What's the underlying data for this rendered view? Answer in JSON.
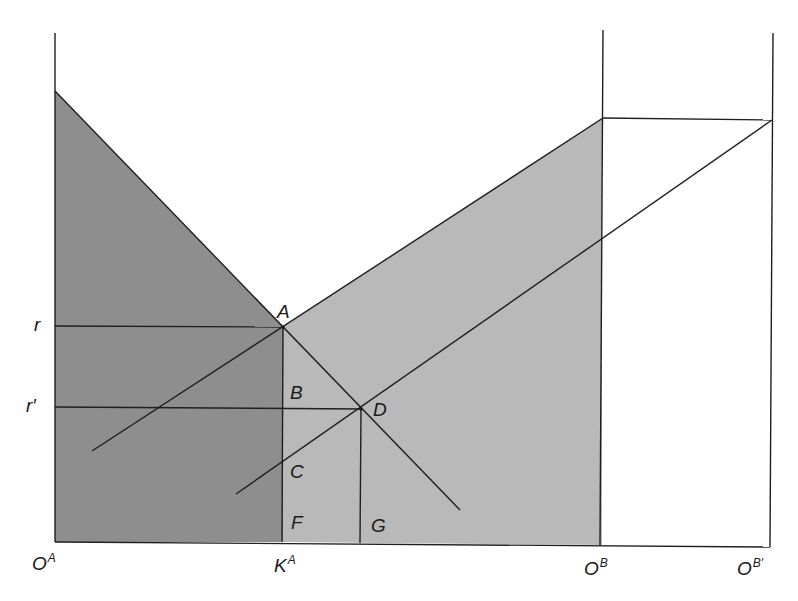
{
  "diagram": {
    "type": "two-country capital allocation (box diagram)",
    "colors": {
      "background": "#ffffff",
      "dark_region": "#8e8e8e",
      "light_region": "#b9b9b9",
      "line": "#1f1f1f"
    },
    "points": {
      "A": "A",
      "B": "B",
      "C": "C",
      "D": "D",
      "F": "F",
      "G": "G"
    },
    "axis_labels": {
      "r": "r",
      "r_prime": "r′",
      "origin_a": {
        "base": "O",
        "sup": "A"
      },
      "k_a": {
        "base": "K",
        "sup": "A"
      },
      "origin_b": {
        "base": "O",
        "sup": "B"
      },
      "origin_b_prime": {
        "base": "O",
        "sup": "B′"
      }
    },
    "regions": [
      {
        "name": "dark-region",
        "description": "area under country A marginal product curve up to K^A"
      },
      {
        "name": "light-region",
        "description": "area under country B marginal product curve from K^A to O^B"
      }
    ]
  }
}
